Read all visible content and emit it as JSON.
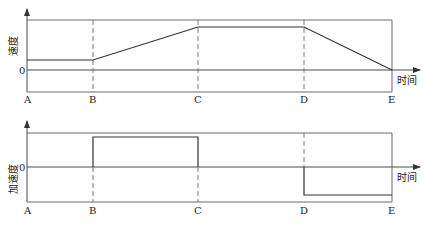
{
  "velocity_chart": {
    "y_label": "速度",
    "zero_label": "0",
    "x_label": "时间",
    "points": [
      "A",
      "B",
      "C",
      "D",
      "E"
    ]
  },
  "acceleration_chart": {
    "y_label": "加速度",
    "zero_label": "0",
    "x_label": "时间",
    "points": [
      "A",
      "B",
      "C",
      "D",
      "E"
    ]
  },
  "colors": {
    "line": "#333333",
    "frame": "#6a6a6a",
    "dash": "#7a7a7a"
  }
}
